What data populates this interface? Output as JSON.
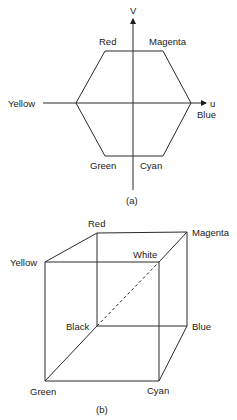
{
  "figure_a": {
    "caption": "(a)",
    "axis_v_label": "V",
    "axis_u_label": "u",
    "vertices": {
      "red": "Red",
      "magenta": "Magenta",
      "yellow": "Yellow",
      "blue": "Blue",
      "green": "Green",
      "cyan": "Cyan"
    }
  },
  "figure_b": {
    "caption": "(b)",
    "vertices": {
      "red": "Red",
      "magenta": "Magenta",
      "yellow": "Yellow",
      "white": "White",
      "black": "Black",
      "blue": "Blue",
      "green": "Green",
      "cyan": "Cyan"
    },
    "diagonal": "Black-White (dashed)"
  }
}
